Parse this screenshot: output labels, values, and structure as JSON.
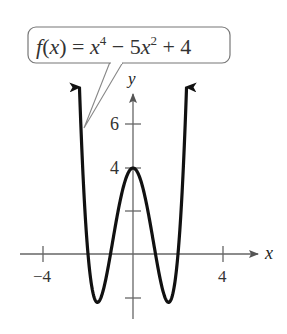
{
  "chart_data": {
    "type": "line",
    "title": "",
    "function_label": {
      "prefix": "f(x) = x",
      "exp1": "4",
      "middle": " − 5x",
      "exp2": "2",
      "suffix": " + 4"
    },
    "expression": "f(x) = x^4 - 5x^2 + 4",
    "xlabel": "x",
    "ylabel": "y",
    "x_ticks": [
      -4,
      4
    ],
    "x_tick_labels": [
      "−4",
      "4"
    ],
    "y_ticks": [
      -2,
      2,
      4,
      6
    ],
    "y_tick_labels": [
      "4",
      "6"
    ],
    "xlim": [
      -4.5,
      5.7
    ],
    "ylim": [
      -3,
      7.5
    ],
    "grid": false,
    "legend": "callout box above graph",
    "key_points": {
      "x_intercepts": [
        -2,
        -1,
        1,
        2
      ],
      "y_intercept": 4,
      "local_max": [
        0,
        4
      ],
      "local_minima": [
        [
          -1.58,
          -2.25
        ],
        [
          1.58,
          -2.25
        ]
      ]
    },
    "series": [
      {
        "name": "f(x) = x^4 - 5x^2 + 4",
        "x": [
          -2.35,
          -2.25,
          -2.0,
          -1.75,
          -1.58,
          -1.25,
          -1.0,
          -0.5,
          0,
          0.5,
          1.0,
          1.25,
          1.58,
          1.75,
          2.0,
          2.25,
          2.35
        ],
        "y": [
          6.89,
          3.31,
          0,
          -1.93,
          -2.25,
          -1.37,
          0,
          2.81,
          4,
          2.81,
          0,
          -1.37,
          -2.25,
          -1.93,
          0,
          3.31,
          6.89
        ]
      }
    ]
  }
}
